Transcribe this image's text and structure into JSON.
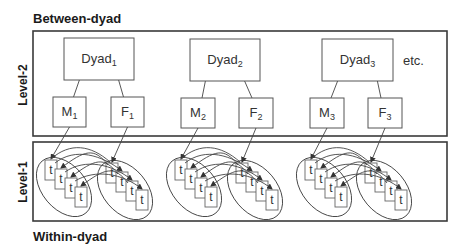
{
  "titles": {
    "top": "Between-dyad",
    "bottom": "Within-dyad"
  },
  "levels": {
    "upper": "Level-2",
    "lower": "Level-1"
  },
  "etc_label": "etc.",
  "dyads": [
    {
      "label": "Dyad",
      "sub": "1",
      "box": {
        "x": 64,
        "y": 38,
        "w": 70,
        "h": 42
      },
      "members": [
        {
          "label": "M",
          "sub": "1",
          "box": {
            "x": 53,
            "y": 97,
            "w": 33,
            "h": 30
          }
        },
        {
          "label": "F",
          "sub": "1",
          "box": {
            "x": 111,
            "y": 97,
            "w": 33,
            "h": 30
          }
        }
      ],
      "clusters_x": [
        36,
        97
      ]
    },
    {
      "label": "Dyad",
      "sub": "2",
      "box": {
        "x": 190,
        "y": 39,
        "w": 70,
        "h": 42
      },
      "members": [
        {
          "label": "M",
          "sub": "2",
          "box": {
            "x": 181,
            "y": 98,
            "w": 34,
            "h": 30
          }
        },
        {
          "label": "F",
          "sub": "2",
          "box": {
            "x": 239,
            "y": 98,
            "w": 34,
            "h": 30
          }
        }
      ],
      "clusters_x": [
        166,
        227
      ]
    },
    {
      "label": "Dyad",
      "sub": "3",
      "box": {
        "x": 322,
        "y": 39,
        "w": 71,
        "h": 42
      },
      "members": [
        {
          "label": "M",
          "sub": "3",
          "box": {
            "x": 310,
            "y": 98,
            "w": 34,
            "h": 30
          }
        },
        {
          "label": "F",
          "sub": "3",
          "box": {
            "x": 368,
            "y": 98,
            "w": 34,
            "h": 30
          }
        }
      ],
      "clusters_x": [
        296,
        356
      ]
    }
  ],
  "time_point_label": "t",
  "time_points_per_member": 4,
  "colors": {
    "stroke": "#444444",
    "text": "#1a1a1a",
    "background": "#ffffff"
  }
}
